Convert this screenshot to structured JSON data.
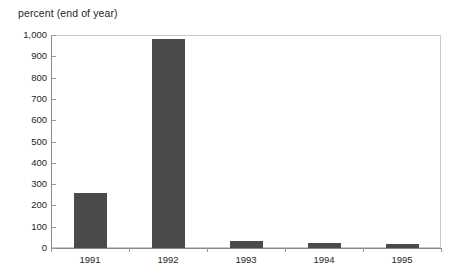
{
  "chart_data": {
    "type": "bar",
    "title": "percent (end of year)",
    "xlabel": "",
    "ylabel": "",
    "categories": [
      "1991",
      "1992",
      "1993",
      "1994",
      "1995"
    ],
    "values": [
      258,
      981,
      33,
      22,
      18
    ],
    "ylim": [
      0,
      1000
    ],
    "yticks": [
      0,
      100,
      200,
      300,
      400,
      500,
      600,
      700,
      800,
      900,
      1000
    ],
    "ytick_labels": [
      "0",
      "100",
      "200",
      "300",
      "400",
      "500",
      "600",
      "700",
      "800",
      "900",
      "1,000"
    ],
    "grid": false,
    "legend": null,
    "bar_color": "#4a4a4a",
    "frame_color": "#c9c9c9",
    "axis_color": "#8a8a8a",
    "text_color": "#231f20"
  }
}
